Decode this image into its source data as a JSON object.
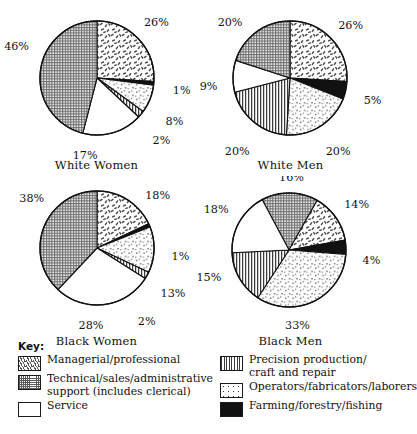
{
  "figure": {
    "legend_title": "Key:",
    "categories": [
      {
        "key": "managerial",
        "label": "Managerial/professional",
        "pattern": "sparse-dashes",
        "color": "#ffffff"
      },
      {
        "key": "technical",
        "label": "Technical/sales/administrative\nsupport (includes clerical)",
        "pattern": "crosshatch",
        "color": "#d9d9d9"
      },
      {
        "key": "service",
        "label": "Service",
        "pattern": "blank",
        "color": "#ffffff"
      },
      {
        "key": "precision",
        "label": "Precision production/\ncraft and repair",
        "pattern": "vertical-lines",
        "color": "#ffffff"
      },
      {
        "key": "operators",
        "label": "Operators/fabricators/laborers",
        "pattern": "sparse-dots",
        "color": "#ffffff"
      },
      {
        "key": "farming",
        "label": "Farming/forestry/fishing",
        "pattern": "solid-black",
        "color": "#111111"
      }
    ]
  },
  "chart_data": [
    {
      "type": "pie",
      "title": "White Women",
      "id": "white-women",
      "start_angle_deg": 0,
      "direction": "clockwise",
      "categories": [
        "Managerial/professional",
        "Farming/forestry/fishing",
        "Operators/fabricators/laborers",
        "Precision production/craft and repair",
        "Service",
        "Technical/sales/administrative support"
      ],
      "keys": [
        "managerial",
        "farming",
        "operators",
        "precision",
        "service",
        "technical"
      ],
      "values": [
        26,
        1,
        8,
        2,
        17,
        46
      ],
      "labels": [
        "26%",
        "1%",
        "8%",
        "2%",
        "17%",
        "46%"
      ]
    },
    {
      "type": "pie",
      "title": "White Men",
      "id": "white-men",
      "start_angle_deg": 0,
      "direction": "clockwise",
      "categories": [
        "Managerial/professional",
        "Farming/forestry/fishing",
        "Operators/fabricators/laborers",
        "Precision production/craft and repair",
        "Service",
        "Technical/sales/administrative support"
      ],
      "keys": [
        "managerial",
        "farming",
        "operators",
        "precision",
        "service",
        "technical"
      ],
      "values": [
        26,
        5,
        20,
        20,
        9,
        20
      ],
      "labels": [
        "26%",
        "5%",
        "20%",
        "20%",
        "9%",
        "20%"
      ]
    },
    {
      "type": "pie",
      "title": "Black Women",
      "id": "black-women",
      "start_angle_deg": 0,
      "direction": "clockwise",
      "categories": [
        "Managerial/professional",
        "Farming/forestry/fishing",
        "Operators/fabricators/laborers",
        "Precision production/craft and repair",
        "Service",
        "Technical/sales/administrative support"
      ],
      "keys": [
        "managerial",
        "farming",
        "operators",
        "precision",
        "service",
        "technical"
      ],
      "values": [
        18,
        1,
        13,
        2,
        28,
        38
      ],
      "labels": [
        "18%",
        "1%",
        "13%",
        "2%",
        "28%",
        "38%"
      ]
    },
    {
      "type": "pie",
      "title": "Black Men",
      "id": "black-men",
      "start_angle_deg": -28,
      "direction": "clockwise",
      "categories": [
        "Technical/sales/administrative support",
        "Managerial/professional",
        "Farming/forestry/fishing",
        "Operators/fabricators/laborers",
        "Precision production/craft and repair",
        "Service"
      ],
      "keys": [
        "technical",
        "managerial",
        "farming",
        "operators",
        "precision",
        "service"
      ],
      "values": [
        16,
        14,
        4,
        33,
        15,
        18
      ],
      "labels": [
        "16%",
        "14%",
        "4%",
        "33%",
        "15%",
        "18%"
      ]
    }
  ]
}
